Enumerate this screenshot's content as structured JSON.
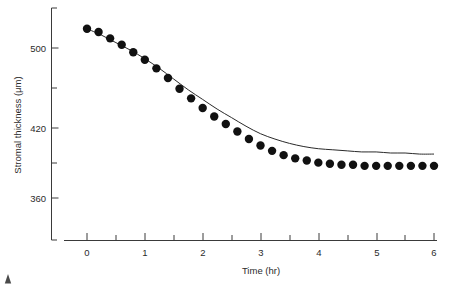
{
  "figure": {
    "title": "",
    "background": "#ffffff",
    "ink_color": "#1a1a1a"
  },
  "axes": {
    "y": {
      "label": "Stromal thickness (μm)",
      "major_ticks": [
        360,
        420,
        500
      ],
      "major_tick_labels": [
        "360",
        "420",
        "500"
      ],
      "minor_ticks": [
        390,
        460,
        540
      ],
      "range": [
        345,
        545
      ]
    },
    "x": {
      "label": "Time (hr)",
      "major_ticks": [
        0,
        1,
        2,
        3,
        4,
        5,
        6
      ],
      "major_tick_labels": [
        "0",
        "1",
        "2",
        "3",
        "4",
        "5",
        "6"
      ],
      "minor_ticks": [
        0.5,
        1.5,
        2.5,
        3.5,
        4.5,
        5.5
      ],
      "range": [
        -0.22,
        6.1
      ]
    }
  },
  "chart_data": {
    "type": "scatter",
    "title": "",
    "xlabel": "Time (hr)",
    "ylabel": "Stromal thickness (μm)",
    "xlim": [
      -0.22,
      6.1
    ],
    "ylim": [
      345,
      545
    ],
    "grid": false,
    "legend": "none",
    "series": [
      {
        "name": "Measured stromal thickness",
        "marker": "filled-circle",
        "marker_color": "#111111",
        "marker_size_px": 4.2,
        "x": [
          0.0,
          0.2,
          0.4,
          0.6,
          0.8,
          1.0,
          1.2,
          1.4,
          1.6,
          1.8,
          2.0,
          2.2,
          2.4,
          2.6,
          2.8,
          3.0,
          3.2,
          3.4,
          3.6,
          3.8,
          4.0,
          4.2,
          4.4,
          4.6,
          4.8,
          5.0,
          5.2,
          5.4,
          5.6,
          5.8,
          6.0
        ],
        "y": [
          518,
          515,
          509,
          503,
          496,
          489,
          481,
          472,
          462,
          453,
          444,
          436,
          429,
          422,
          415,
          409,
          404,
          400,
          397,
          395,
          393,
          392,
          391,
          391,
          390,
          390,
          390,
          390,
          390,
          390,
          390
        ]
      },
      {
        "name": "Fitted decay curve",
        "marker": "none",
        "line_color": "#2a2a2a",
        "line_width_px": 1,
        "x": [
          0.0,
          0.25,
          0.5,
          0.75,
          1.0,
          1.25,
          1.5,
          1.75,
          2.0,
          2.25,
          2.5,
          2.75,
          3.0,
          3.25,
          3.5,
          3.75,
          4.0,
          4.25,
          4.5,
          4.75,
          5.0,
          5.25,
          5.5,
          5.75,
          6.0
        ],
        "y": [
          518,
          512,
          505,
          498,
          490,
          481,
          471,
          461,
          452,
          443,
          435,
          427,
          420,
          415,
          411,
          408,
          406,
          405,
          404,
          403,
          403,
          402,
          402,
          401,
          401
        ]
      }
    ]
  }
}
